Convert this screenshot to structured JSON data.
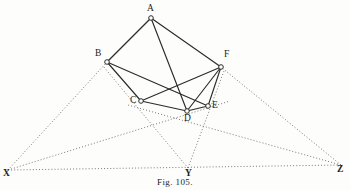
{
  "figure": {
    "caption": "Fig. 105.",
    "background_color": "#fdfdfc",
    "solid_line_color": "#2b2b2b",
    "dotted_line_color": "#6a6a68",
    "vertex_fill_color": "#ffffff"
  },
  "vertices": [
    {
      "id": "A",
      "label": "A",
      "x": 151,
      "y": 18,
      "label_x": 147,
      "label_y": 4,
      "marker": true
    },
    {
      "id": "B",
      "label": "B",
      "x": 107,
      "y": 62,
      "label_x": 95,
      "label_y": 49,
      "marker": true
    },
    {
      "id": "F",
      "label": "F",
      "x": 221,
      "y": 67,
      "label_x": 224,
      "label_y": 50,
      "marker": true
    },
    {
      "id": "C",
      "label": "C",
      "x": 141,
      "y": 101,
      "label_x": 130,
      "label_y": 96,
      "marker": true
    },
    {
      "id": "E",
      "label": "E",
      "x": 208,
      "y": 106,
      "label_x": 212,
      "label_y": 101,
      "marker": true
    },
    {
      "id": "D",
      "label": "D",
      "x": 187,
      "y": 111,
      "label_x": 184,
      "label_y": 114,
      "marker": true
    },
    {
      "id": "X",
      "label": "X",
      "x": 8,
      "y": 170,
      "label_x": 3,
      "label_y": 169,
      "marker": false
    },
    {
      "id": "Y",
      "label": "Y",
      "x": 188,
      "y": 168,
      "label_x": 185,
      "label_y": 169,
      "marker": false
    },
    {
      "id": "Z",
      "label": "Z",
      "x": 341,
      "y": 165,
      "label_x": 337,
      "label_y": 165,
      "marker": false
    }
  ],
  "solid_edges": [
    {
      "name": "edge-A-B",
      "from": "A",
      "to": "B"
    },
    {
      "name": "edge-A-F",
      "from": "A",
      "to": "F"
    },
    {
      "name": "edge-A-D",
      "from": "A",
      "to": "D"
    },
    {
      "name": "edge-B-C",
      "from": "B",
      "to": "C"
    },
    {
      "name": "edge-B-E",
      "from": "B",
      "to": "E"
    },
    {
      "name": "edge-C-F",
      "from": "C",
      "to": "F"
    },
    {
      "name": "edge-C-D",
      "from": "C",
      "to": "D"
    },
    {
      "name": "edge-D-E",
      "from": "D",
      "to": "E"
    },
    {
      "name": "edge-E-F",
      "from": "E",
      "to": "F"
    },
    {
      "name": "edge-D-F",
      "from": "D",
      "to": "F"
    }
  ],
  "dotted_edges": [
    {
      "name": "dotted-X-B",
      "x1": 8,
      "y1": 170,
      "x2": 107,
      "y2": 62
    },
    {
      "name": "dotted-X-E",
      "x1": 8,
      "y1": 170,
      "x2": 230,
      "y2": 101
    },
    {
      "name": "dotted-X-Z",
      "x1": 8,
      "y1": 170,
      "x2": 341,
      "y2": 165
    },
    {
      "name": "dotted-Z-F",
      "x1": 341,
      "y1": 165,
      "x2": 221,
      "y2": 67
    },
    {
      "name": "dotted-Z-C",
      "x1": 341,
      "y1": 165,
      "x2": 128,
      "y2": 105
    },
    {
      "name": "dotted-Y-B",
      "x1": 188,
      "y1": 168,
      "x2": 103,
      "y2": 66
    },
    {
      "name": "dotted-Y-F",
      "x1": 188,
      "y1": 168,
      "x2": 224,
      "y2": 71
    }
  ]
}
